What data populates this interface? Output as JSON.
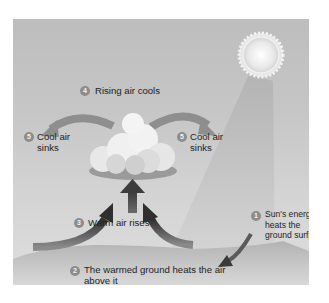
{
  "diagram": {
    "colors": {
      "sky_top": "#bdbdbd",
      "sky_bottom": "#dedede",
      "badge": "#8c8c8c",
      "arrow_dark": "#3c3c3c",
      "arrow_light": "#8a8a8a",
      "sun": "#f5f5f5",
      "ground": "#bfbfbf",
      "text": "#1e1e1e"
    },
    "steps": [
      {
        "number": "1",
        "lines": [
          "Sun's energy",
          "heats the",
          "ground surface"
        ]
      },
      {
        "number": "2",
        "lines": [
          "The warmed ground heats the air",
          "above it"
        ]
      },
      {
        "number": "3",
        "lines": [
          "Warm air rises"
        ]
      },
      {
        "number": "4",
        "lines": [
          "Rising air cools"
        ]
      },
      {
        "number": "5",
        "lines": [
          "Cool air",
          "sinks"
        ],
        "side": "left"
      },
      {
        "number": "5",
        "lines": [
          "Cool air",
          "sinks"
        ],
        "side": "right"
      }
    ],
    "elements": [
      "sun",
      "sunbeam",
      "cloud",
      "ground",
      "rising-arrows",
      "sinking-arrows"
    ]
  }
}
